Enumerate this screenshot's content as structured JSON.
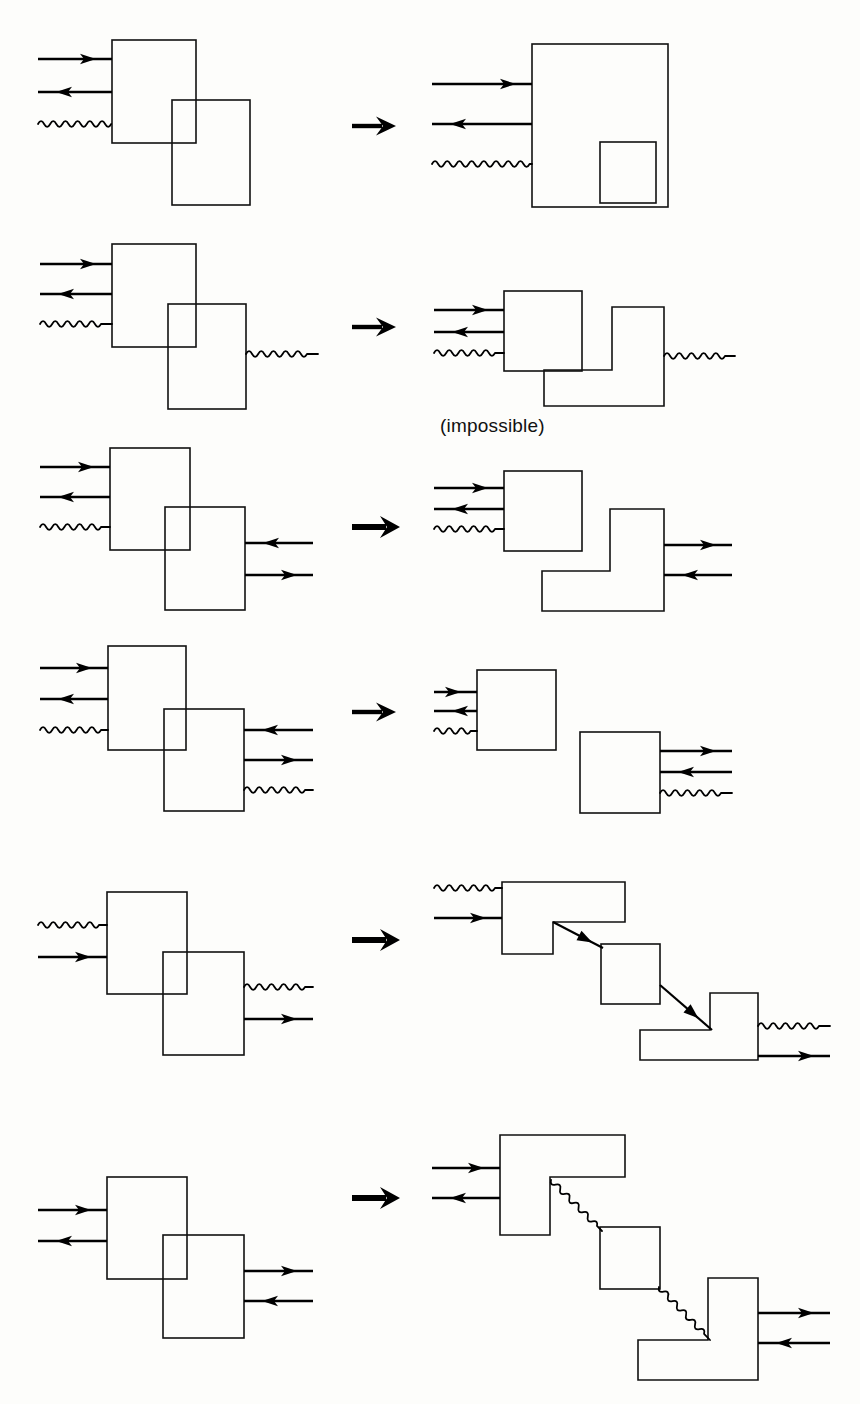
{
  "figure": {
    "background_color": "#fdfdfb",
    "ink_color": "#000000",
    "width": 860,
    "height": 1404,
    "row_count": 6,
    "captions": [
      {
        "id": "impossible-label",
        "text": "(impossible)",
        "x": 440,
        "y": 432
      }
    ],
    "rows": [
      {
        "id": "row-1",
        "index": 1,
        "transform_arrow": {
          "x": 352,
          "y": 126,
          "style": "thin",
          "label": "transforms-into"
        },
        "left": {
          "description": "Two overlapping rectangles; three left-side connectors enter the upper box",
          "shapes": [
            {
              "name": "upper-box",
              "type": "rect",
              "x": 112,
              "y": 40,
              "w": 84,
              "h": 103
            },
            {
              "name": "lower-box",
              "type": "rect",
              "x": 172,
              "y": 100,
              "w": 78,
              "h": 105
            }
          ],
          "connectors": [
            {
              "name": "input-arrow-right",
              "type": "arrow",
              "direction": "right",
              "x1": 38,
              "y": 59,
              "x2": 112
            },
            {
              "name": "input-arrow-left",
              "type": "arrow",
              "direction": "left",
              "x1": 38,
              "y": 92,
              "x2": 112
            },
            {
              "name": "input-wave",
              "type": "wave",
              "x1": 38,
              "y": 124,
              "x2": 112
            }
          ]
        },
        "right": {
          "description": "One large rectangle with a small rectangle nested in its bottom-right corner",
          "shapes": [
            {
              "name": "outer-box",
              "type": "rect",
              "x": 532,
              "y": 44,
              "w": 136,
              "h": 163
            },
            {
              "name": "inner-box",
              "type": "rect",
              "x": 600,
              "y": 142,
              "w": 56,
              "h": 61
            }
          ],
          "connectors": [
            {
              "name": "input-arrow-right",
              "type": "arrow",
              "direction": "right",
              "x1": 432,
              "y": 84,
              "x2": 532
            },
            {
              "name": "input-arrow-left",
              "type": "arrow",
              "direction": "left",
              "x1": 432,
              "y": 124,
              "x2": 532
            },
            {
              "name": "input-wave",
              "type": "wave",
              "x1": 432,
              "y": 164,
              "x2": 532
            }
          ]
        }
      },
      {
        "id": "row-2",
        "index": 2,
        "transform_arrow": {
          "x": 352,
          "y": 327,
          "style": "thin",
          "label": "transforms-into"
        },
        "left": {
          "description": "Two overlapping rectangles; three connectors in on the left, one wave out on the right",
          "shapes": [
            {
              "name": "upper-box",
              "type": "rect",
              "x": 112,
              "y": 244,
              "w": 84,
              "h": 103
            },
            {
              "name": "lower-box",
              "type": "rect",
              "x": 168,
              "y": 304,
              "w": 78,
              "h": 105
            }
          ],
          "connectors": [
            {
              "name": "input-arrow-right",
              "type": "arrow",
              "direction": "right",
              "x1": 40,
              "y": 264,
              "x2": 112
            },
            {
              "name": "input-arrow-left",
              "type": "arrow",
              "direction": "left",
              "x1": 40,
              "y": 294,
              "x2": 112
            },
            {
              "name": "input-wave",
              "type": "wave",
              "x1": 40,
              "y": 324,
              "x2": 112
            },
            {
              "name": "output-wave",
              "type": "wave",
              "x1": 246,
              "y": 354,
              "x2": 318
            }
          ]
        },
        "right": {
          "description": "A square and a separate rotated L-shape; marked impossible",
          "shapes": [
            {
              "name": "square-box",
              "type": "rect",
              "x": 504,
              "y": 291,
              "w": 78,
              "h": 80
            },
            {
              "name": "l-shape",
              "type": "polygon",
              "points": "612,307 664,307 664,406 544,406 544,370 612,370"
            }
          ],
          "connectors": [
            {
              "name": "input-arrow-right",
              "type": "arrow",
              "direction": "right",
              "x1": 434,
              "y": 310,
              "x2": 504
            },
            {
              "name": "input-arrow-left",
              "type": "arrow",
              "direction": "left",
              "x1": 434,
              "y": 332,
              "x2": 504
            },
            {
              "name": "input-wave",
              "type": "wave",
              "x1": 434,
              "y": 353,
              "x2": 504
            },
            {
              "name": "output-wave",
              "type": "wave",
              "x1": 664,
              "y": 356,
              "x2": 735
            }
          ]
        }
      },
      {
        "id": "row-3",
        "index": 3,
        "transform_arrow": {
          "x": 352,
          "y": 527,
          "style": "bold",
          "label": "transforms-into"
        },
        "left": {
          "description": "Two overlapping rectangles; three connectors in at left, two arrows at right of lower box",
          "shapes": [
            {
              "name": "upper-box",
              "type": "rect",
              "x": 110,
              "y": 448,
              "w": 80,
              "h": 102
            },
            {
              "name": "lower-box",
              "type": "rect",
              "x": 165,
              "y": 507,
              "w": 80,
              "h": 103
            }
          ],
          "connectors": [
            {
              "name": "input-arrow-right",
              "type": "arrow",
              "direction": "right",
              "x1": 40,
              "y": 467,
              "x2": 110
            },
            {
              "name": "input-arrow-left",
              "type": "arrow",
              "direction": "left",
              "x1": 40,
              "y": 497,
              "x2": 110
            },
            {
              "name": "input-wave",
              "type": "wave",
              "x1": 40,
              "y": 527,
              "x2": 110
            },
            {
              "name": "right-arrow-left",
              "type": "arrow",
              "direction": "left",
              "x1": 245,
              "y": 543,
              "x2": 313
            },
            {
              "name": "right-arrow-right",
              "type": "arrow",
              "direction": "right",
              "x1": 245,
              "y": 575,
              "x2": 313
            }
          ]
        },
        "right": {
          "description": "A square and a separate rotated L-shape with two arrows leaving the L-shape",
          "shapes": [
            {
              "name": "square-box",
              "type": "rect",
              "x": 504,
              "y": 471,
              "w": 78,
              "h": 80
            },
            {
              "name": "l-shape",
              "type": "polygon",
              "points": "610,509 664,509 664,611 542,611 542,571 610,571"
            }
          ],
          "connectors": [
            {
              "name": "input-arrow-right",
              "type": "arrow",
              "direction": "right",
              "x1": 434,
              "y": 488,
              "x2": 504
            },
            {
              "name": "input-arrow-left",
              "type": "arrow",
              "direction": "left",
              "x1": 434,
              "y": 509,
              "x2": 504
            },
            {
              "name": "input-wave",
              "type": "wave",
              "x1": 434,
              "y": 529,
              "x2": 504
            },
            {
              "name": "output-arrow-right",
              "type": "arrow",
              "direction": "right",
              "x1": 664,
              "y": 545,
              "x2": 732
            },
            {
              "name": "output-arrow-left",
              "type": "arrow",
              "direction": "left",
              "x1": 664,
              "y": 575,
              "x2": 732
            }
          ]
        }
      },
      {
        "id": "row-4",
        "index": 4,
        "transform_arrow": {
          "x": 352,
          "y": 712,
          "style": "thin",
          "label": "transforms-into"
        },
        "left": {
          "description": "Two overlapping rectangles; three connectors in at left, three out at right",
          "shapes": [
            {
              "name": "upper-box",
              "type": "rect",
              "x": 108,
              "y": 646,
              "w": 78,
              "h": 104
            },
            {
              "name": "lower-box",
              "type": "rect",
              "x": 164,
              "y": 709,
              "w": 80,
              "h": 102
            }
          ],
          "connectors": [
            {
              "name": "input-arrow-right",
              "type": "arrow",
              "direction": "right",
              "x1": 40,
              "y": 668,
              "x2": 108
            },
            {
              "name": "input-arrow-left",
              "type": "arrow",
              "direction": "left",
              "x1": 40,
              "y": 699,
              "x2": 108
            },
            {
              "name": "input-wave",
              "type": "wave",
              "x1": 40,
              "y": 730,
              "x2": 108
            },
            {
              "name": "output-arrow-left",
              "type": "arrow",
              "direction": "left",
              "x1": 244,
              "y": 730,
              "x2": 313
            },
            {
              "name": "output-arrow-right",
              "type": "arrow",
              "direction": "right",
              "x1": 244,
              "y": 760,
              "x2": 313
            },
            {
              "name": "output-wave",
              "type": "wave",
              "x1": 244,
              "y": 790,
              "x2": 313
            }
          ]
        },
        "right": {
          "description": "Two fully separated squares, each with its own three connectors",
          "shapes": [
            {
              "name": "first-square",
              "type": "rect",
              "x": 477,
              "y": 670,
              "w": 79,
              "h": 80
            },
            {
              "name": "second-square",
              "type": "rect",
              "x": 580,
              "y": 732,
              "w": 80,
              "h": 81
            }
          ],
          "connectors": [
            {
              "name": "input-arrow-right",
              "type": "arrow",
              "direction": "right",
              "x1": 434,
              "y": 692,
              "x2": 477
            },
            {
              "name": "input-arrow-left",
              "type": "arrow",
              "direction": "left",
              "x1": 434,
              "y": 711,
              "x2": 477
            },
            {
              "name": "input-wave",
              "type": "wave",
              "x1": 434,
              "y": 731,
              "x2": 477
            },
            {
              "name": "output-arrow-right",
              "type": "arrow",
              "direction": "right",
              "x1": 660,
              "y": 751,
              "x2": 732
            },
            {
              "name": "output-arrow-left",
              "type": "arrow",
              "direction": "left",
              "x1": 660,
              "y": 772,
              "x2": 732
            },
            {
              "name": "output-wave",
              "type": "wave",
              "x1": 660,
              "y": 793,
              "x2": 732
            }
          ]
        }
      },
      {
        "id": "row-5",
        "index": 5,
        "transform_arrow": {
          "x": 352,
          "y": 940,
          "style": "bold",
          "label": "transforms-into"
        },
        "left": {
          "description": "Two overlapping rectangles; wave and arrow in at left, wave and arrow out at right",
          "shapes": [
            {
              "name": "upper-box",
              "type": "rect",
              "x": 107,
              "y": 892,
              "w": 80,
              "h": 102
            },
            {
              "name": "lower-box",
              "type": "rect",
              "x": 163,
              "y": 952,
              "w": 81,
              "h": 103
            }
          ],
          "connectors": [
            {
              "name": "input-wave",
              "type": "wave",
              "x1": 38,
              "y": 925,
              "x2": 107
            },
            {
              "name": "input-arrow-right",
              "type": "arrow",
              "direction": "right",
              "x1": 38,
              "y": 957,
              "x2": 107
            },
            {
              "name": "output-wave",
              "type": "wave",
              "x1": 244,
              "y": 987,
              "x2": 313
            },
            {
              "name": "output-arrow-right",
              "type": "arrow",
              "direction": "right",
              "x1": 244,
              "y": 1019,
              "x2": 313
            }
          ]
        },
        "right": {
          "description": "Staircase of three shapes connected by straight diagonal arrows",
          "shapes": [
            {
              "name": "upper-l-shape",
              "type": "polygon",
              "points": "502,882 625,882 625,922 553,922 553,954 502,954"
            },
            {
              "name": "middle-square",
              "type": "rect",
              "x": 601,
              "y": 944,
              "w": 59,
              "h": 60
            },
            {
              "name": "lower-t-shape",
              "type": "polygon",
              "points": "710,993 758,993 758,1060 640,1060 640,1030 710,1030"
            }
          ],
          "connectors": [
            {
              "name": "input-wave",
              "type": "wave",
              "x1": 434,
              "y": 888,
              "x2": 502
            },
            {
              "name": "input-arrow-right",
              "type": "arrow",
              "direction": "right",
              "x1": 434,
              "y": 918,
              "x2": 502
            },
            {
              "name": "diagonal-arrow-upper",
              "type": "diagonal-arrow",
              "x1": 553,
              "y1": 922,
              "x2": 603,
              "y2": 948
            },
            {
              "name": "diagonal-arrow-lower",
              "type": "diagonal-arrow",
              "x1": 660,
              "y1": 985,
              "x2": 712,
              "y2": 1030
            },
            {
              "name": "output-wave",
              "type": "wave",
              "x1": 758,
              "y": 1026,
              "x2": 830
            },
            {
              "name": "output-arrow-right",
              "type": "arrow",
              "direction": "right",
              "x1": 758,
              "y": 1056,
              "x2": 830
            }
          ]
        }
      },
      {
        "id": "row-6",
        "index": 6,
        "transform_arrow": {
          "x": 352,
          "y": 1198,
          "style": "bold",
          "label": "transforms-into"
        },
        "left": {
          "description": "Two overlapping rectangles; two arrows in at left, two arrows out at right",
          "shapes": [
            {
              "name": "upper-box",
              "type": "rect",
              "x": 107,
              "y": 1177,
              "w": 80,
              "h": 102
            },
            {
              "name": "lower-box",
              "type": "rect",
              "x": 163,
              "y": 1235,
              "w": 81,
              "h": 103
            }
          ],
          "connectors": [
            {
              "name": "input-arrow-right",
              "type": "arrow",
              "direction": "right",
              "x1": 38,
              "y": 1210,
              "x2": 107
            },
            {
              "name": "input-arrow-left",
              "type": "arrow",
              "direction": "left",
              "x1": 38,
              "y": 1241,
              "x2": 107
            },
            {
              "name": "output-arrow-right",
              "type": "arrow",
              "direction": "right",
              "x1": 244,
              "y": 1271,
              "x2": 313
            },
            {
              "name": "output-arrow-left",
              "type": "arrow",
              "direction": "left",
              "x1": 244,
              "y": 1301,
              "x2": 313
            }
          ]
        },
        "right": {
          "description": "Staircase of three shapes connected by wavy diagonal links",
          "shapes": [
            {
              "name": "upper-l-shape",
              "type": "polygon",
              "points": "500,1135 625,1135 625,1177 550,1177 550,1235 500,1235"
            },
            {
              "name": "middle-square",
              "type": "rect",
              "x": 600,
              "y": 1227,
              "w": 60,
              "h": 62
            },
            {
              "name": "lower-t-shape",
              "type": "polygon",
              "points": "708,1278 758,1278 758,1380 638,1380 638,1340 708,1340"
            }
          ],
          "connectors": [
            {
              "name": "input-arrow-right",
              "type": "arrow",
              "direction": "right",
              "x1": 432,
              "y": 1168,
              "x2": 500
            },
            {
              "name": "input-arrow-left",
              "type": "arrow",
              "direction": "left",
              "x1": 432,
              "y": 1198,
              "x2": 500
            },
            {
              "name": "diagonal-wave-upper",
              "type": "diagonal-wave",
              "x1": 551,
              "y1": 1180,
              "x2": 602,
              "y2": 1231
            },
            {
              "name": "diagonal-wave-lower",
              "type": "diagonal-wave",
              "x1": 659,
              "y1": 1287,
              "x2": 710,
              "y2": 1340
            },
            {
              "name": "output-arrow-right",
              "type": "arrow",
              "direction": "right",
              "x1": 758,
              "y": 1313,
              "x2": 830
            },
            {
              "name": "output-arrow-left",
              "type": "arrow",
              "direction": "left",
              "x1": 758,
              "y": 1343,
              "x2": 830
            }
          ]
        }
      }
    ]
  }
}
